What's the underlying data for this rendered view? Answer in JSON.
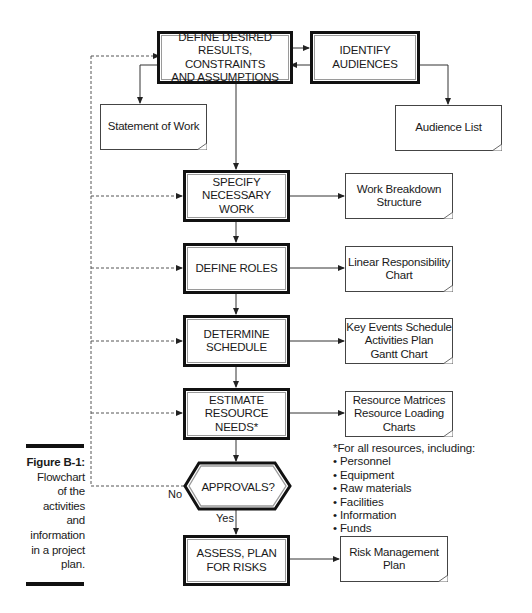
{
  "figure": {
    "label": "Figure B-1:",
    "caption": "Flowchart\nof the\nactivities\nand\ninformation\nin a project\nplan."
  },
  "process_steps": [
    {
      "id": "define",
      "label": "DEFINE DESIRED\nRESULTS, CONSTRAINTS\nAND ASSUMPTIONS"
    },
    {
      "id": "identify",
      "label": "IDENTIFY\nAUDIENCES"
    },
    {
      "id": "specify",
      "label": "SPECIFY\nNECESSARY\nWORK"
    },
    {
      "id": "roles",
      "label": "DEFINE ROLES"
    },
    {
      "id": "schedule",
      "label": "DETERMINE\nSCHEDULE"
    },
    {
      "id": "resources",
      "label": "ESTIMATE\nRESOURCE NEEDS*"
    },
    {
      "id": "risks",
      "label": "ASSESS, PLAN\nFOR RISKS"
    }
  ],
  "decision": {
    "label": "APPROVALS?",
    "yes_label": "Yes",
    "no_label": "No"
  },
  "documents": [
    {
      "id": "sow",
      "label": "Statement of Work"
    },
    {
      "id": "audience",
      "label": "Audience List"
    },
    {
      "id": "wbs",
      "label": "Work Breakdown\nStructure"
    },
    {
      "id": "lrc",
      "label": "Linear Responsibility\nChart"
    },
    {
      "id": "sched",
      "label": "Key Events Schedule\nActivities Plan\nGantt Chart"
    },
    {
      "id": "res",
      "label": "Resource Matrices\nResource Loading\nCharts"
    },
    {
      "id": "risk",
      "label": "Risk Management\nPlan"
    }
  ],
  "footnote": {
    "title": "*For all resources, including:",
    "items": [
      "Personnel",
      "Equipment",
      "Raw materials",
      "Facilities",
      "Information",
      "Funds"
    ]
  },
  "colors": {
    "stroke": "#111111",
    "inner_border": "#9a9a9a",
    "background": "#ffffff"
  }
}
